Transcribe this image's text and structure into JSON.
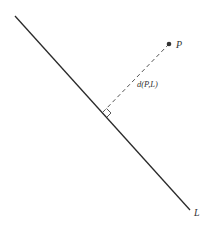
{
  "diagram": {
    "line_label": "L",
    "point_label": "P",
    "distance_label": "d(P,L)",
    "colors": {
      "line": "#2a2a2a",
      "dashed": "#555555",
      "point": "#333333",
      "text": "#333333"
    }
  }
}
